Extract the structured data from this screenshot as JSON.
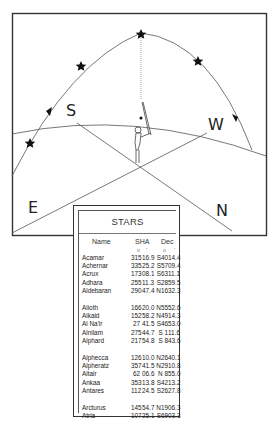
{
  "diagram": {
    "cardinal_labels": {
      "south": "S",
      "west": "W",
      "east": "E",
      "north": "N"
    },
    "star_icon": "star-icon",
    "arrow_icon": "arrow-icon",
    "observer_icon": "observer-figure-icon"
  },
  "table": {
    "title": "STARS",
    "headers": {
      "name": "Name",
      "sha": "SHA",
      "dec": "Dec"
    },
    "units": {
      "deg": "o",
      "min": "'"
    },
    "groups": [
      [
        {
          "name": "Acamar",
          "sha_deg": "315",
          "sha_min": "16.9",
          "dec_deg": "S40",
          "dec_min": "14.4"
        },
        {
          "name": "Achernar",
          "sha_deg": "335",
          "sha_min": "25.2",
          "dec_deg": "S57",
          "dec_min": "09.4"
        },
        {
          "name": "Acrux",
          "sha_deg": "173",
          "sha_min": "08.1",
          "dec_deg": "S63",
          "dec_min": "11.1"
        },
        {
          "name": "Adhara",
          "sha_deg": "255",
          "sha_min": "11.3",
          "dec_deg": "S28",
          "dec_min": "59.5"
        },
        {
          "name": "Aldebaran",
          "sha_deg": "290",
          "sha_min": "47.4",
          "dec_deg": "N16",
          "dec_min": "32.3"
        }
      ],
      [
        {
          "name": "Alioth",
          "sha_deg": "166",
          "sha_min": "20.0",
          "dec_deg": "N55",
          "dec_min": "52.6"
        },
        {
          "name": "Alkaid",
          "sha_deg": "152",
          "sha_min": "58.2",
          "dec_deg": "N49",
          "dec_min": "14.3"
        },
        {
          "name": "Al Na'ir",
          "sha_deg": "27",
          "sha_min": "41.5",
          "dec_deg": "S46",
          "dec_min": "53.0"
        },
        {
          "name": "Alnilam",
          "sha_deg": "275",
          "sha_min": "44.7",
          "dec_deg": "S 1",
          "dec_min": "11.6"
        },
        {
          "name": "Alphard",
          "sha_deg": "217",
          "sha_min": "54.8",
          "dec_deg": "S 8",
          "dec_min": "43.6"
        }
      ],
      [
        {
          "name": "Alphecca",
          "sha_deg": "126",
          "sha_min": "10.0",
          "dec_deg": "N26",
          "dec_min": "40.1"
        },
        {
          "name": "Alpheratz",
          "sha_deg": "357",
          "sha_min": "41.5",
          "dec_deg": "N29",
          "dec_min": "10.8"
        },
        {
          "name": "Altair",
          "sha_deg": "62",
          "sha_min": "06.6",
          "dec_deg": "N 8",
          "dec_min": "55.0"
        },
        {
          "name": "Ankaa",
          "sha_deg": "353",
          "sha_min": "13.8",
          "dec_deg": "S42",
          "dec_min": "13.2"
        },
        {
          "name": "Antares",
          "sha_deg": "112",
          "sha_min": "24.5",
          "dec_deg": "S26",
          "dec_min": "27.8"
        }
      ],
      [
        {
          "name": "Arcturus",
          "sha_deg": "145",
          "sha_min": "54.7",
          "dec_deg": "N19",
          "dec_min": "06.3"
        },
        {
          "name": "Atria",
          "sha_deg": "107",
          "sha_min": "25.1",
          "dec_deg": "S69",
          "dec_min": "03.3"
        }
      ]
    ]
  }
}
